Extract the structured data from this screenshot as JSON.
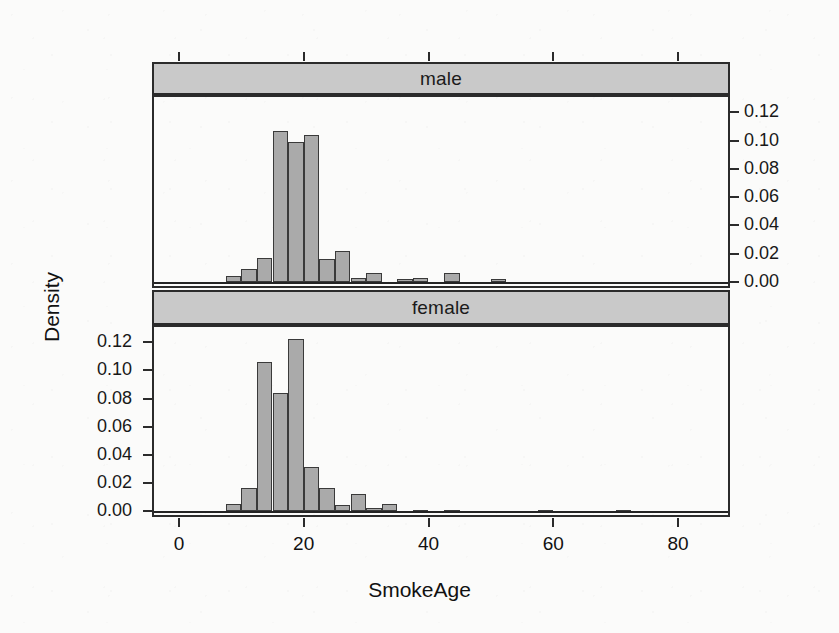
{
  "figure": {
    "x_axis_title": "SmokeAge",
    "y_axis_title": "Density",
    "panels": [
      {
        "strip_label": "male"
      },
      {
        "strip_label": "female"
      }
    ],
    "x_tick_labels": [
      "0",
      "20",
      "40",
      "60",
      "80"
    ],
    "y_tick_labels": [
      "0.00",
      "0.02",
      "0.04",
      "0.06",
      "0.08",
      "0.10",
      "0.12"
    ],
    "colors": {
      "bar_fill": "#aaaaaa",
      "bar_border": "#3a3a3a",
      "strip_fill": "#c9c9c9",
      "frame": "#2b2b2b",
      "background": "#fbfbfa",
      "text": "#111111"
    }
  },
  "chart_data": {
    "type": "bar",
    "title": "",
    "subtitle": "",
    "xlabel": "SmokeAge",
    "ylabel": "Density",
    "xlim": [
      -4,
      88
    ],
    "ylim": [
      0.0,
      0.128
    ],
    "grid": false,
    "legend": "none",
    "layout": "2 stacked conditioning panels (lattice histogram), shared x axis",
    "bin_width": 2.5,
    "x_ticks": [
      0,
      20,
      40,
      60,
      80
    ],
    "y_ticks": [
      0.0,
      0.02,
      0.04,
      0.06,
      0.08,
      0.1,
      0.12
    ],
    "panels": [
      {
        "name": "male",
        "y_axis_side": "right",
        "bins": [
          {
            "x0": 5.0,
            "x1": 7.5,
            "density": 0.0
          },
          {
            "x0": 7.5,
            "x1": 10.0,
            "density": 0.004
          },
          {
            "x0": 10.0,
            "x1": 12.5,
            "density": 0.009
          },
          {
            "x0": 12.5,
            "x1": 15.0,
            "density": 0.017
          },
          {
            "x0": 15.0,
            "x1": 17.5,
            "density": 0.106
          },
          {
            "x0": 17.5,
            "x1": 20.0,
            "density": 0.098
          },
          {
            "x0": 20.0,
            "x1": 22.5,
            "density": 0.103
          },
          {
            "x0": 22.5,
            "x1": 25.0,
            "density": 0.016
          },
          {
            "x0": 25.0,
            "x1": 27.5,
            "density": 0.022
          },
          {
            "x0": 27.5,
            "x1": 30.0,
            "density": 0.003
          },
          {
            "x0": 30.0,
            "x1": 32.5,
            "density": 0.006
          },
          {
            "x0": 32.5,
            "x1": 35.0,
            "density": 0.0
          },
          {
            "x0": 35.0,
            "x1": 37.5,
            "density": 0.002
          },
          {
            "x0": 37.5,
            "x1": 40.0,
            "density": 0.003
          },
          {
            "x0": 42.5,
            "x1": 45.0,
            "density": 0.006
          },
          {
            "x0": 50.0,
            "x1": 52.5,
            "density": 0.002
          }
        ]
      },
      {
        "name": "female",
        "y_axis_side": "left",
        "bins": [
          {
            "x0": 7.5,
            "x1": 10.0,
            "density": 0.005
          },
          {
            "x0": 10.0,
            "x1": 12.5,
            "density": 0.016
          },
          {
            "x0": 12.5,
            "x1": 15.0,
            "density": 0.105
          },
          {
            "x0": 15.0,
            "x1": 17.5,
            "density": 0.083
          },
          {
            "x0": 17.5,
            "x1": 20.0,
            "density": 0.121
          },
          {
            "x0": 20.0,
            "x1": 22.5,
            "density": 0.031
          },
          {
            "x0": 22.5,
            "x1": 25.0,
            "density": 0.016
          },
          {
            "x0": 25.0,
            "x1": 27.5,
            "density": 0.004
          },
          {
            "x0": 27.5,
            "x1": 30.0,
            "density": 0.012
          },
          {
            "x0": 30.0,
            "x1": 32.5,
            "density": 0.002
          },
          {
            "x0": 32.5,
            "x1": 35.0,
            "density": 0.005
          },
          {
            "x0": 37.5,
            "x1": 40.0,
            "density": 0.001
          },
          {
            "x0": 42.5,
            "x1": 45.0,
            "density": 0.001
          },
          {
            "x0": 57.5,
            "x1": 60.0,
            "density": 0.001
          },
          {
            "x0": 70.0,
            "x1": 72.5,
            "density": 0.001
          }
        ]
      }
    ]
  }
}
